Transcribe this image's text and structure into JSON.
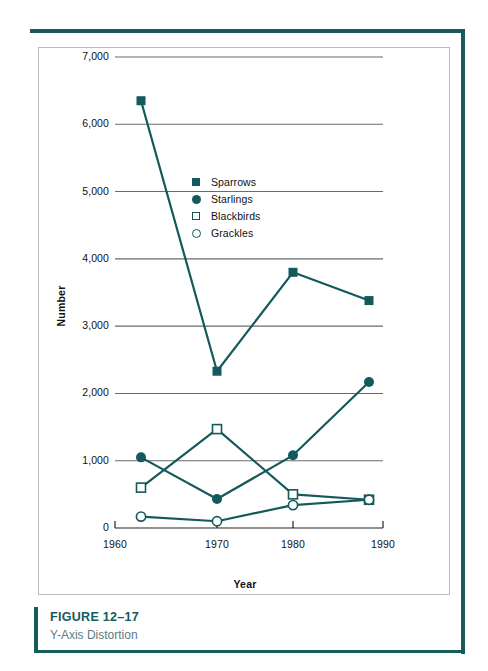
{
  "figure": {
    "number": "FIGURE 12–17",
    "title": "Y-Axis Distortion"
  },
  "colors": {
    "accent_teal": "#14595b",
    "gridline": "#6b6b6b",
    "panel_border": "#b9bcbd",
    "caption_title": "#5d7c80"
  },
  "legend": {
    "position": "inside-upper-left",
    "items": [
      {
        "label": "Sparrows",
        "marker": "filled-square",
        "icon": "filled-square-icon"
      },
      {
        "label": "Starlings",
        "marker": "filled-circle",
        "icon": "filled-circle-icon"
      },
      {
        "label": "Blackbirds",
        "marker": "open-square",
        "icon": "open-square-icon"
      },
      {
        "label": "Grackles",
        "marker": "open-circle",
        "icon": "open-circle-icon"
      }
    ]
  },
  "axes": {
    "y_title": "Number",
    "x_title": "Year",
    "y_ticks": [
      "0",
      "1,000",
      "2,000",
      "3,000",
      "4,000",
      "5,000",
      "6,000",
      "7,000"
    ],
    "x_ticks": [
      "1960",
      "1970",
      "1980",
      "1990"
    ]
  },
  "chart_data": {
    "type": "line",
    "title": "Y-Axis Distortion",
    "xlabel": "Year",
    "ylabel": "Number",
    "x": [
      1960,
      1970,
      1980,
      1990
    ],
    "categories": [
      "1960",
      "1970",
      "1980",
      "1990"
    ],
    "xlim": [
      1955,
      1995
    ],
    "ylim": [
      0,
      7000
    ],
    "yticks": [
      0,
      1000,
      2000,
      3000,
      4000,
      5000,
      6000,
      7000
    ],
    "ytick_labels": [
      "0",
      "1,000",
      "2,000",
      "3,000",
      "4,000",
      "5,000",
      "6,000",
      "7,000"
    ],
    "xticks": [
      1960,
      1970,
      1980,
      1990
    ],
    "grid": "horizontal-partial",
    "legend_position": "inside-upper-left",
    "series": [
      {
        "name": "Sparrows",
        "marker": "filled-square",
        "values": [
          6350,
          2330,
          3800,
          3380
        ]
      },
      {
        "name": "Starlings",
        "marker": "filled-circle",
        "values": [
          1050,
          430,
          1080,
          2170
        ]
      },
      {
        "name": "Blackbirds",
        "marker": "open-square",
        "values": [
          600,
          1470,
          500,
          420
        ]
      },
      {
        "name": "Grackles",
        "marker": "open-circle",
        "values": [
          170,
          100,
          340,
          420
        ]
      }
    ]
  }
}
